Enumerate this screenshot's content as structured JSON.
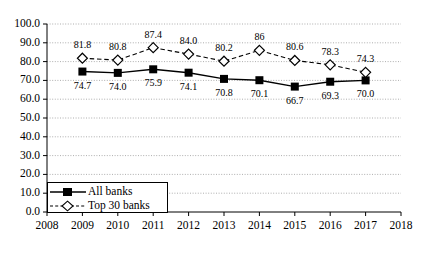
{
  "chart_data": {
    "type": "line",
    "title": "",
    "xlabel": "",
    "ylabel": "",
    "x": [
      2009,
      2010,
      2011,
      2012,
      2013,
      2014,
      2015,
      2016,
      2017
    ],
    "xlim": [
      2008,
      2018
    ],
    "ylim": [
      0.0,
      100.0
    ],
    "grid": true,
    "legend_position": "bottom-left",
    "xticks": [
      "2008",
      "2009",
      "2010",
      "2011",
      "2012",
      "2013",
      "2014",
      "2015",
      "2016",
      "2017",
      "2018"
    ],
    "yticks": [
      "0.0",
      "10.0",
      "20.0",
      "30.0",
      "40.0",
      "50.0",
      "60.0",
      "70.0",
      "80.0",
      "90.0",
      "100.0"
    ],
    "series": [
      {
        "name": "All banks",
        "marker": "filled-square",
        "linestyle": "solid",
        "color": "#000000",
        "values": [
          74.7,
          74.0,
          75.9,
          74.1,
          70.8,
          70.1,
          66.7,
          69.3,
          70.0
        ],
        "labels": [
          "74.7",
          "74.0",
          "75.9",
          "74.1",
          "70.8",
          "70.1",
          "66.7",
          "69.3",
          "70.0"
        ]
      },
      {
        "name": "Top 30 banks",
        "marker": "open-diamond",
        "linestyle": "dashed",
        "color": "#000000",
        "values": [
          81.8,
          80.8,
          87.4,
          84.0,
          80.2,
          86.0,
          80.6,
          78.3,
          74.3
        ],
        "labels": [
          "81.8",
          "80.8",
          "87.4",
          "84.0",
          "80.2",
          "86",
          "80.6",
          "78.3",
          "74.3"
        ]
      }
    ]
  },
  "legend": {
    "items": [
      {
        "label": "All banks"
      },
      {
        "label": "Top 30 banks"
      }
    ]
  }
}
